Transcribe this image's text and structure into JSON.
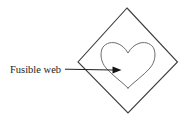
{
  "figure": {
    "background_color": "#ffffff",
    "width": 182,
    "height": 120
  },
  "labels": {
    "fusible_web": "Fusible web"
  },
  "shapes": {
    "diamond": {
      "name": "fabric-diamond",
      "points": "127,8 177,62 128,113 78,62",
      "stroke_color": "#3d3d3d",
      "fill_color": "#ffffff"
    },
    "heart": {
      "name": "fusible-web-heart",
      "stroke_color": "#6b6b6b",
      "fill_color": "#ffffff",
      "bounds": {
        "left": 101,
        "right": 155,
        "top": 42,
        "bottom": 88
      }
    }
  },
  "annotations": {
    "leader": {
      "name": "fusible-web-leader",
      "from_x": 65,
      "from_y": 69,
      "to_x": 113,
      "to_y": 70,
      "stroke_color": "#1f1f1f"
    },
    "arrow": {
      "name": "fusible-web-arrow",
      "tip_x": 121,
      "tip_y": 70,
      "fill_color": "#141414"
    },
    "label_position": {
      "x": 10,
      "y": 73
    }
  }
}
